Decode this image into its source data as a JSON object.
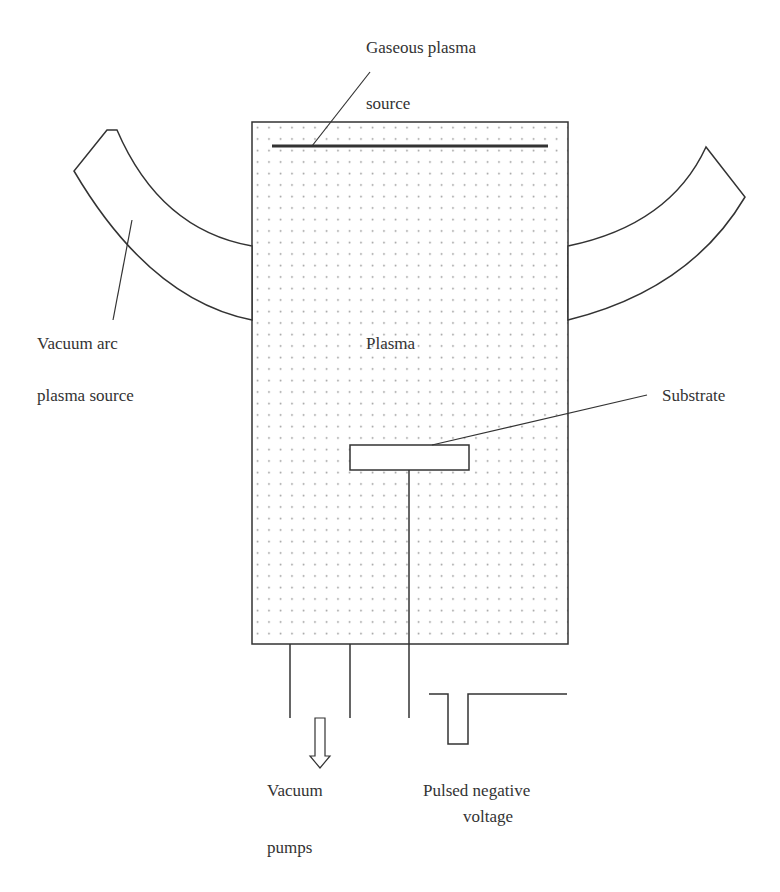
{
  "diagram": {
    "type": "schematic",
    "colors": {
      "stroke": "#333333",
      "dots": "#9a9a9a",
      "background": "#ffffff"
    },
    "labels": {
      "gaseous_line1": "Gaseous plasma",
      "gaseous_line2": "source",
      "vacuum_arc_line1": "Vacuum arc",
      "vacuum_arc_line2": "plasma source",
      "plasma": "Plasma",
      "substrate": "Substrate",
      "vacuum_line1": "Vacuum",
      "vacuum_line2": "pumps",
      "pulse_line1": "Pulsed negative",
      "pulse_line2": "voltage"
    },
    "components": [
      {
        "id": "chamber",
        "label": "Plasma",
        "fill": "dotted"
      },
      {
        "id": "gaseous-plasma-source",
        "label": "Gaseous plasma source"
      },
      {
        "id": "vacuum-arc-source-left",
        "label": "Vacuum arc plasma source"
      },
      {
        "id": "vacuum-arc-source-right"
      },
      {
        "id": "substrate",
        "label": "Substrate"
      },
      {
        "id": "vacuum-pumps",
        "label": "Vacuum pumps"
      },
      {
        "id": "pulse-generator",
        "label": "Pulsed negative voltage"
      }
    ]
  }
}
